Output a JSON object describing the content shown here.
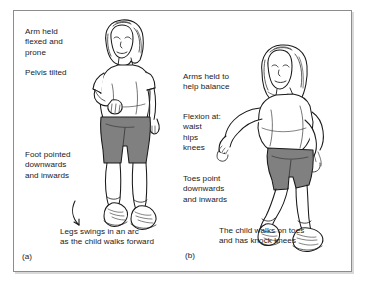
{
  "figure": {
    "background_color": "#ffffff",
    "frame_border_color": "#8c8c8c",
    "ink_color": "#1a1a1a",
    "shorts_fill": "#808080",
    "skin_fill": "#ffffff"
  },
  "panels": [
    {
      "id": "a",
      "label": "(a)",
      "summary_caption": "Legs swings in an arc\nas the child walks forward",
      "annotations": [
        {
          "name": "arm",
          "text": "Arm held\nflexed and\nprone"
        },
        {
          "name": "pelvis",
          "text": "Pelvis tilted"
        },
        {
          "name": "foot",
          "text": "Foot pointed\ndownwards\nand inwards"
        }
      ],
      "figure_description": "child standing, arm flexed across chest, pelvis tilted, foot plantarflexed and inverted",
      "arrow": {
        "name": "arc-arrow",
        "shape": "curved arc"
      }
    },
    {
      "id": "b",
      "label": "(b)",
      "summary_caption": "The child walks on toes\nand has knock knees",
      "annotations": [
        {
          "name": "arms-balance",
          "text": "Arms held to\nhelp balance"
        },
        {
          "name": "flexion",
          "text": "Flexion at:\nwaist\nhips\nknees"
        },
        {
          "name": "toes",
          "text": "Toes point\ndownwards\nand inwards"
        }
      ],
      "figure_description": "child crouched forward, arms extended outward for balance, knock knees, walking on toes"
    }
  ]
}
